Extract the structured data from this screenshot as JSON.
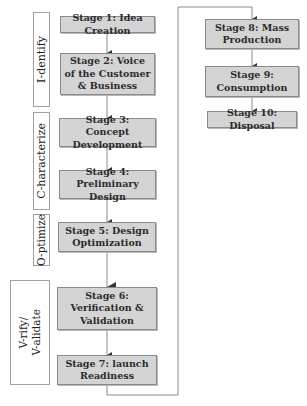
{
  "diagram": {
    "phases": [
      {
        "id": "identify",
        "label": "I-dentify"
      },
      {
        "id": "characterize",
        "label": "C-haracterize"
      },
      {
        "id": "optimize",
        "label": "O-ptimize"
      },
      {
        "id": "verify",
        "label": "V-rify/\nV-alidate"
      }
    ],
    "stages": [
      {
        "label": "Stage 1: Idea Creation",
        "phase": "identify"
      },
      {
        "label": "Stage 2: Voice of the Customer & Business",
        "phase": "identify"
      },
      {
        "label": "Stage 3: Concept Development",
        "phase": "characterize"
      },
      {
        "label": "Stage 4: Preliminary Design",
        "phase": "characterize"
      },
      {
        "label": "Stage 5: Design Optimization",
        "phase": "optimize"
      },
      {
        "label": "Stage 6: Verification & Validation",
        "phase": "verify"
      },
      {
        "label": "Stage 7: launch Readiness",
        "phase": "verify"
      },
      {
        "label": "Stage 8: Mass Production",
        "phase": ""
      },
      {
        "label": "Stage 9: Consumption",
        "phase": ""
      },
      {
        "label": "Stage 10: Disposal",
        "phase": ""
      }
    ],
    "colors": {
      "box_fill": "#d4d4d4",
      "box_border": "#8a8a8a",
      "line": "#8c8c8c",
      "arrow": "#333333"
    }
  }
}
